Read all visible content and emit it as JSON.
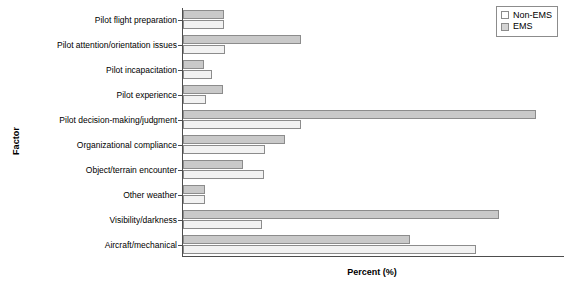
{
  "chart_data": {
    "type": "bar",
    "orientation": "horizontal",
    "title": "",
    "xlabel": "Percent (%)",
    "ylabel": "Factor",
    "xlim": [
      0,
      43
    ],
    "grid": false,
    "legend_position": "top-right",
    "categories": [
      "Pilot flight preparation",
      "Pilot attention/orientation issues",
      "Pilot incapacitation",
      "Pilot experience",
      "Pilot decision-making/judgment",
      "Organizational compliance",
      "Object/terrain encounter",
      "Other weather",
      "Visibility/darkness",
      "Aircraft/mechanical"
    ],
    "series": [
      {
        "name": "Non-EMS",
        "color": "#f2f2f2",
        "values": [
          4.6,
          4.7,
          3.3,
          2.6,
          13.4,
          9.3,
          9.2,
          2.5,
          8.9,
          33.2
        ]
      },
      {
        "name": "EMS",
        "color": "#c9c9c9",
        "values": [
          4.6,
          13.4,
          2.4,
          4.5,
          40.0,
          11.5,
          6.8,
          2.5,
          35.8,
          25.7
        ]
      }
    ]
  },
  "legend": {
    "items": [
      {
        "label": "Non-EMS",
        "swatch": "nonems"
      },
      {
        "label": "EMS",
        "swatch": "ems"
      }
    ]
  }
}
